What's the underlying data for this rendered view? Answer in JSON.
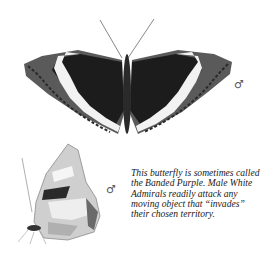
{
  "illustration": {
    "top_figure": {
      "label": "Male White Admiral butterfly, upperside view",
      "sex_symbol": "♂"
    },
    "bottom_figure": {
      "label": "Male White Admiral butterfly, underside side view",
      "sex_symbol": "♂"
    }
  },
  "caption": {
    "lines": [
      "This butterfly is sometimes called",
      "the Banded Purple. Male White",
      "Admirals readily attack any",
      "moving object that “invades”",
      "their chosen territory."
    ]
  },
  "colors": {
    "background": "#ffffff",
    "wing_dark": "#1c1c1c",
    "band_white": "#f4f4f4",
    "border": "#6a6a6a",
    "text": "#1a1a1a"
  }
}
